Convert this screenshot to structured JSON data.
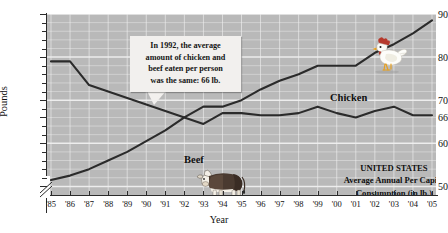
{
  "chart_data": {
    "type": "line",
    "title": "",
    "xlabel": "Year",
    "ylabel": "Pounds",
    "ylim": [
      48,
      90
    ],
    "grid": true,
    "legend_position": "inline-labels",
    "axis_break": true,
    "categories": [
      "'85",
      "'86",
      "'87",
      "'88",
      "'89",
      "'90",
      "'91",
      "'92",
      "'93",
      "'94",
      "'95",
      "'96",
      "'97",
      "'98",
      "'99",
      "'00",
      "'01",
      "'02",
      "'03",
      "'04",
      "'05"
    ],
    "x_tick_labels": [
      "'85",
      "'86",
      "'87",
      "'88",
      "'89",
      "'90",
      "'91",
      "'92",
      "'93",
      "'94",
      "'95",
      "'96",
      "'97",
      "'98",
      "'99",
      "'00",
      "'01",
      "'02",
      "'03",
      "'04",
      "'05"
    ],
    "y_tick_labels": [
      "90",
      "80",
      "70",
      "66",
      "60",
      "50"
    ],
    "y_tick_values": [
      90,
      80,
      70,
      66,
      60,
      50
    ],
    "series": [
      {
        "name": "Beef",
        "values": [
          79.0,
          79.0,
          73.5,
          72.0,
          70.5,
          69.0,
          67.5,
          66.0,
          64.5,
          67.0,
          67.0,
          66.5,
          66.5,
          67.0,
          68.5,
          67.0,
          66.0,
          67.5,
          68.5,
          66.5,
          66.5
        ]
      },
      {
        "name": "Chicken",
        "values": [
          51.5,
          52.5,
          54.0,
          56.0,
          58.0,
          60.5,
          63.0,
          66.0,
          68.5,
          68.5,
          70.0,
          72.5,
          74.5,
          76.0,
          78.0,
          78.0,
          78.0,
          81.0,
          83.0,
          85.5,
          88.5
        ]
      }
    ],
    "annotations": [
      {
        "name": "callout",
        "lines": [
          "In 1992, the average",
          "amount of chicken and",
          "beef eaten per person",
          "was the same: 66 lb."
        ],
        "points_to_year": "'92",
        "points_to_value": 66
      },
      {
        "name": "source-block",
        "lines": [
          "UNITED STATES",
          "Average Annual Per Capita",
          "Consumption (in lb.)"
        ]
      }
    ],
    "colors": {
      "plot_background": "#b9b9b9",
      "gridline": "#f0f0f0",
      "line": "#2b2b2b",
      "axis": "#2b2b2b",
      "callout_background": "#f2f0ee",
      "text": "#101010"
    },
    "illustrations": [
      {
        "name": "chicken-illustration",
        "label": "rooster"
      },
      {
        "name": "cow-illustration",
        "label": "beef cow"
      }
    ]
  },
  "axis": {
    "y_title": "Pounds",
    "x_title": "Year"
  },
  "series_labels": {
    "chicken": "Chicken",
    "beef": "Beef"
  },
  "callout": {
    "line1": "In 1992, the average",
    "line2": "amount of chicken and",
    "line3": "beef eaten per person",
    "line4": "was the same: 66 lb."
  },
  "source_block": {
    "line1": "UNITED STATES",
    "line2": "Average Annual Per Capita",
    "line3": "Consumption (in lb.)"
  }
}
